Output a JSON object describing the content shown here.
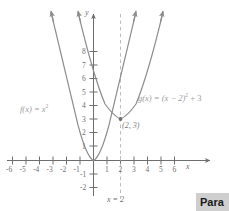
{
  "figure": {
    "axes": {
      "x_axis_label": "x",
      "y_axis_label": "y",
      "x_ticks": [
        "-6",
        "-5",
        "-4",
        "-3",
        "-2",
        "-1",
        "1",
        "2",
        "3",
        "4",
        "5",
        "6"
      ],
      "x_tick_values": [
        -6,
        -5,
        -4,
        -3,
        -2,
        -1,
        1,
        2,
        3,
        4,
        5,
        6
      ],
      "y_ticks": [
        "8",
        "7",
        "6",
        "5",
        "4",
        "3",
        "2",
        "1",
        "-1",
        "-2"
      ],
      "y_tick_values": [
        8,
        7,
        6,
        5,
        4,
        3,
        2,
        1,
        -1,
        -2
      ],
      "xlim": [
        -7,
        7
      ],
      "ylim": [
        -2.6,
        9.6
      ]
    },
    "curves": [
      {
        "name": "f",
        "label": "f(x) = x",
        "label_exponent": "2",
        "expression": "f(x) = x^2",
        "vertex": [
          0,
          0
        ],
        "color": "#8c8c8c"
      },
      {
        "name": "g",
        "label_part1": "g(x) = (x − 2)",
        "label_exponent": "2",
        "label_part2": " + 3",
        "expression": "g(x) = (x - 2)^2 + 3",
        "vertex": [
          2,
          3
        ],
        "color": "#8c8c8c"
      }
    ],
    "annotations": {
      "vertex_point_label": "(2, 3)",
      "vertical_line_label": "x = 2",
      "vertical_line_x": 2
    }
  },
  "footer": {
    "badge_label": "Para"
  },
  "colors": {
    "curve": "#8c8c8c",
    "axis": "#6e6e6e",
    "dashed": "#bdbdbd",
    "badge_bg": "#cfcfcf"
  }
}
